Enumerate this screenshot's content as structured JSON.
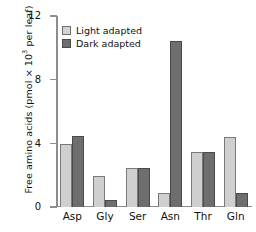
{
  "chart_data": {
    "type": "bar",
    "title": "",
    "xlabel": "",
    "ylabel": "Free amino acids (pmol × 10³ per leaf)",
    "ylabel_prefix": "Free amino acids (pmol × 10",
    "ylabel_exponent": "3",
    "ylabel_suffix": " per leaf)",
    "categories": [
      "Asp",
      "Gly",
      "Ser",
      "Asn",
      "Thr",
      "Gln"
    ],
    "series": [
      {
        "name": "Light adapted",
        "color": "#cfcfcf",
        "values": [
          3.95,
          1.95,
          2.45,
          0.9,
          3.45,
          4.4
        ]
      },
      {
        "name": "Dark adapted",
        "color": "#6e6e6e",
        "values": [
          4.45,
          0.45,
          2.45,
          10.4,
          3.45,
          0.85
        ]
      }
    ],
    "ylim": [
      0,
      12
    ],
    "yticks": [
      0,
      4,
      8,
      12
    ],
    "ytick_labels": [
      "0",
      "4",
      "8",
      "12"
    ],
    "grid": false,
    "legend_position": "top-left"
  },
  "legend": {
    "items": [
      {
        "label": "Light adapted",
        "swatch": "light-swatch"
      },
      {
        "label": "Dark adapted",
        "swatch": "dark-swatch"
      }
    ]
  }
}
